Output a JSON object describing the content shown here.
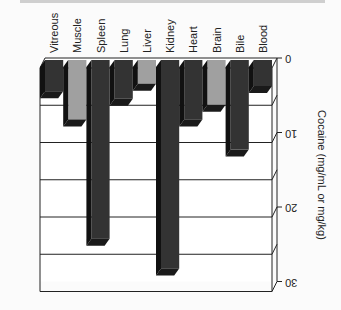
{
  "chart_data": {
    "type": "bar",
    "orientation": "rotated-3d (values increase downward, labels rotated 90°)",
    "categories": [
      "Vitreous",
      "Muscle",
      "Spleen",
      "Lung",
      "Liver",
      "Kidney",
      "Heart",
      "Brain",
      "Bile",
      "Blood"
    ],
    "values": [
      4.2,
      8,
      24,
      5.2,
      3.2,
      28,
      8,
      6,
      12,
      3.5
    ],
    "bar_colors": [
      "#333333",
      "#a0a0a0",
      "#333333",
      "#333333",
      "#a0a0a0",
      "#333333",
      "#333333",
      "#a0a0a0",
      "#333333",
      "#333333"
    ],
    "title": "",
    "xlabel": "",
    "ylabel": "Cocaine (mg/mL or mg/kg)",
    "yticks": [
      "0",
      "10",
      "20",
      "30"
    ],
    "ylim": [
      0,
      30
    ],
    "grid": true
  }
}
